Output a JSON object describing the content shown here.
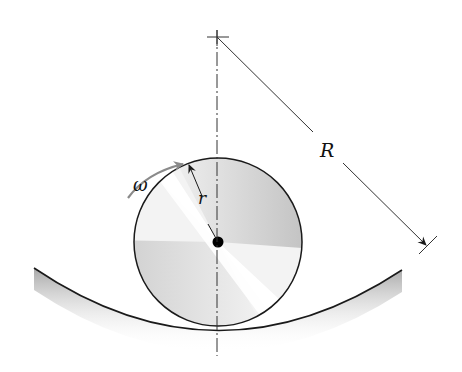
{
  "diagram": {
    "labels": {
      "omega": "ω",
      "small_radius": "r",
      "large_radius": "R"
    },
    "colors": {
      "line": "#1a1a1a",
      "axis": "#333333",
      "arrow_gray": "#8a8a8a",
      "shadow": "#9a9a9a"
    }
  }
}
